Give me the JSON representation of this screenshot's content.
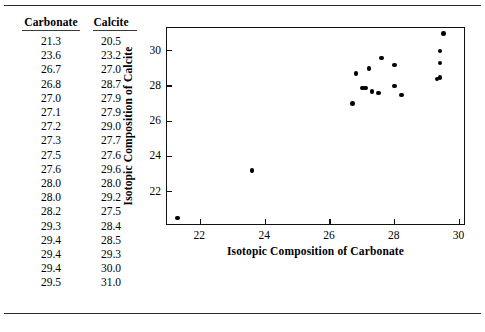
{
  "table": {
    "headers": [
      "Carbonate",
      "Calcite"
    ],
    "rows": [
      {
        "carbonate": "21.3",
        "calcite": "20.5"
      },
      {
        "carbonate": "23.6",
        "calcite": "23.2"
      },
      {
        "carbonate": "26.7",
        "calcite": "27.0"
      },
      {
        "carbonate": "26.8",
        "calcite": "28.7"
      },
      {
        "carbonate": "27.0",
        "calcite": "27.9"
      },
      {
        "carbonate": "27.1",
        "calcite": "27.9"
      },
      {
        "carbonate": "27.2",
        "calcite": "29.0"
      },
      {
        "carbonate": "27.3",
        "calcite": "27.7"
      },
      {
        "carbonate": "27.5",
        "calcite": "27.6"
      },
      {
        "carbonate": "27.6",
        "calcite": "29.6"
      },
      {
        "carbonate": "28.0",
        "calcite": "28.0"
      },
      {
        "carbonate": "28.0",
        "calcite": "29.2"
      },
      {
        "carbonate": "28.2",
        "calcite": "27.5"
      },
      {
        "carbonate": "29.3",
        "calcite": "28.4"
      },
      {
        "carbonate": "29.4",
        "calcite": "28.5"
      },
      {
        "carbonate": "29.4",
        "calcite": "29.3"
      },
      {
        "carbonate": "29.4",
        "calcite": "30.0"
      },
      {
        "carbonate": "29.5",
        "calcite": "31.0"
      }
    ]
  },
  "chart_data": {
    "type": "scatter",
    "title": "",
    "xlabel": "Isotopic Composition of Carbonate",
    "ylabel": "Isotopic Composition of Calcite",
    "xlim": [
      20.97,
      30.2
    ],
    "ylim": [
      20.05,
      31.3
    ],
    "xticks": [
      22,
      24,
      26,
      28,
      30
    ],
    "yticks": [
      22,
      24,
      26,
      28,
      30
    ],
    "xticklabels": [
      "22",
      "24",
      "26",
      "28",
      "30"
    ],
    "yticklabels": [
      "22",
      "24",
      "26",
      "28",
      "30"
    ],
    "grid": false,
    "legend": null,
    "marker": "filled-circle",
    "marker_color": "#000000",
    "x": [
      21.3,
      23.6,
      26.7,
      26.8,
      27.0,
      27.1,
      27.2,
      27.3,
      27.5,
      27.6,
      28.0,
      28.0,
      28.2,
      29.3,
      29.4,
      29.4,
      29.4,
      29.5
    ],
    "y": [
      20.5,
      23.2,
      27.0,
      28.7,
      27.9,
      27.9,
      29.0,
      27.7,
      27.6,
      29.6,
      28.0,
      29.2,
      27.5,
      28.4,
      28.5,
      29.3,
      30.0,
      31.0
    ]
  }
}
